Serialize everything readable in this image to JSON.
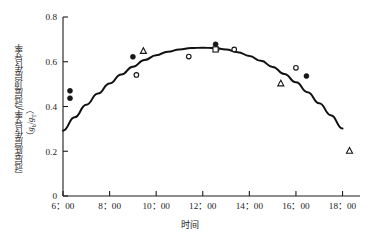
{
  "chart_data": {
    "type": "scatter",
    "title": "",
    "subtitle": "",
    "xlabel": "时间",
    "ylabel": "冠层底层传导率/冠层顶层传导率",
    "ylabel_unit": "g_b/g_T",
    "xlim": [
      6,
      18.75
    ],
    "ylim": [
      0,
      0.8
    ],
    "grid": false,
    "legend": "none",
    "x_tick_labels": [
      "6：00",
      "8：00",
      "10：00",
      "12：00",
      "14：00",
      "16：00",
      "18：00"
    ],
    "x_tick_values": [
      6,
      8,
      10,
      12,
      14,
      16,
      18
    ],
    "y_tick_labels": [
      "0",
      "0.2",
      "0.4",
      "0.6",
      "0.8"
    ],
    "y_tick_values": [
      0,
      0.2,
      0.4,
      0.6,
      0.8
    ],
    "series": [
      {
        "name": "filled-circle",
        "marker": "filled-circle",
        "points": [
          {
            "x": 6.3,
            "y": 0.47
          },
          {
            "x": 6.3,
            "y": 0.437
          },
          {
            "x": 9.0,
            "y": 0.622
          },
          {
            "x": 12.55,
            "y": 0.678
          },
          {
            "x": 16.45,
            "y": 0.536
          }
        ]
      },
      {
        "name": "open-circle",
        "marker": "open-circle",
        "points": [
          {
            "x": 9.15,
            "y": 0.541
          },
          {
            "x": 11.4,
            "y": 0.623
          },
          {
            "x": 12.6,
            "y": 0.657
          },
          {
            "x": 13.35,
            "y": 0.655
          },
          {
            "x": 16.0,
            "y": 0.573
          }
        ]
      },
      {
        "name": "open-triangle",
        "marker": "open-triangle",
        "points": [
          {
            "x": 9.45,
            "y": 0.648
          },
          {
            "x": 15.35,
            "y": 0.503
          },
          {
            "x": 18.3,
            "y": 0.202
          }
        ]
      },
      {
        "name": "open-square",
        "marker": "open-square",
        "points": [
          {
            "x": 12.55,
            "y": 0.655
          }
        ]
      }
    ],
    "fit_curve": {
      "name": "quadratic-fit",
      "style": "solid",
      "points": [
        {
          "x": 6.0,
          "y": 0.292
        },
        {
          "x": 6.5,
          "y": 0.352
        },
        {
          "x": 7.0,
          "y": 0.408
        },
        {
          "x": 7.5,
          "y": 0.458
        },
        {
          "x": 8.0,
          "y": 0.503
        },
        {
          "x": 8.5,
          "y": 0.543
        },
        {
          "x": 9.0,
          "y": 0.578
        },
        {
          "x": 9.5,
          "y": 0.608
        },
        {
          "x": 10.0,
          "y": 0.629
        },
        {
          "x": 10.5,
          "y": 0.645
        },
        {
          "x": 11.0,
          "y": 0.655
        },
        {
          "x": 11.5,
          "y": 0.661
        },
        {
          "x": 12.0,
          "y": 0.663
        },
        {
          "x": 12.5,
          "y": 0.661
        },
        {
          "x": 13.0,
          "y": 0.655
        },
        {
          "x": 13.5,
          "y": 0.643
        },
        {
          "x": 14.0,
          "y": 0.626
        },
        {
          "x": 14.5,
          "y": 0.604
        },
        {
          "x": 15.0,
          "y": 0.577
        },
        {
          "x": 15.5,
          "y": 0.545
        },
        {
          "x": 16.0,
          "y": 0.508
        },
        {
          "x": 16.5,
          "y": 0.464
        },
        {
          "x": 17.0,
          "y": 0.415
        },
        {
          "x": 17.5,
          "y": 0.361
        },
        {
          "x": 18.0,
          "y": 0.302
        }
      ]
    }
  }
}
